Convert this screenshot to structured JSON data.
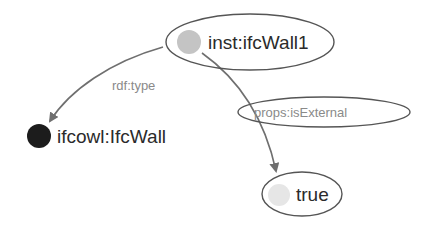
{
  "diagram": {
    "type": "rdf-graph",
    "nodes": [
      {
        "id": "inst_ifcWall1",
        "label": "inst:ifcWall1",
        "kind": "instance",
        "dot_color": "#c4c4c4",
        "circled": true
      },
      {
        "id": "ifcowl_IfcWall",
        "label": "ifcowl:IfcWall",
        "kind": "class",
        "dot_color": "#1c1c1c",
        "circled": false
      },
      {
        "id": "true_literal",
        "label": "true",
        "kind": "literal",
        "dot_color": "#e6e6e6",
        "circled": true
      }
    ],
    "edges": [
      {
        "from": "inst_ifcWall1",
        "to": "ifcowl_IfcWall",
        "label": "rdf:type",
        "label_circled": false
      },
      {
        "from": "inst_ifcWall1",
        "to": "true_literal",
        "label": "props:isExternal",
        "label_circled": true
      }
    ],
    "colors": {
      "edge": "#6f6f6f",
      "ellipse_stroke": "#555555",
      "text": "#2b2b2b",
      "edge_label": "#8a8a8a"
    }
  }
}
